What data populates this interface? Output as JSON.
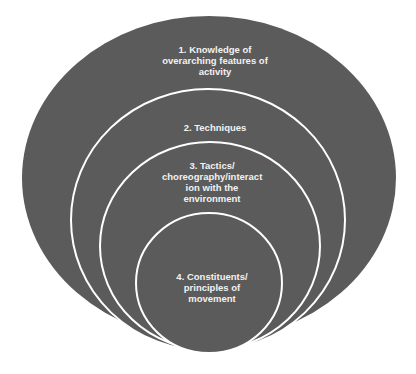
{
  "diagram": {
    "type": "nested-ellipses",
    "fill_color": "#5b5b5b",
    "stroke_color": "#ffffff",
    "levels": [
      {
        "id": 1,
        "label": "1. Knowledge of overarching features of activity"
      },
      {
        "id": 2,
        "label": "2. Techniques"
      },
      {
        "id": 3,
        "label": "3. Tactics/ choreography/interact ion with the environment"
      },
      {
        "id": 4,
        "label": "4. Constituents/ principles of movement"
      }
    ]
  }
}
